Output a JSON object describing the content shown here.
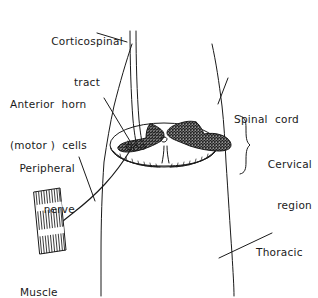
{
  "figure": {
    "type": "anatomical-diagram",
    "ink_color": "#1a1a1a",
    "background_color": "#ffffff"
  },
  "labels": {
    "corticospinal_tract": {
      "line1": "Corticospinal",
      "line2": "tract",
      "align": "center"
    },
    "anterior_horn_cells": {
      "line1": "Anterior  horn",
      "line2": "(motor )  cells",
      "align": "left"
    },
    "peripheral_nerve": {
      "line1": "Peripheral",
      "line2": "nerve",
      "align": "right"
    },
    "muscle": {
      "line1": "Muscle",
      "align": "left"
    },
    "spinal_cord": {
      "line1": "Spinal  cord",
      "align": "left"
    },
    "cervical_region": {
      "line1": "Cervical",
      "line2": "region",
      "align": "right"
    },
    "thoracic": {
      "line1": "Thoracic",
      "align": "left"
    }
  },
  "structures": {
    "spinal_cord_section": "elliptical cross-section of cervical spinal cord",
    "gray_matter": "stippled butterfly-shaped grey matter with anterior and posterior horns",
    "corticospinal_tract": "two parallel descending fibres entering the lateral column",
    "anterior_horn_cells": "cluster of small motor neuron cell bodies in the anterior horn",
    "peripheral_nerve": "axon leaving the cord and running to the muscle",
    "muscle": "striated muscle belly with vertical fibres",
    "cervical_brace": "right-hand brace marking the cervical region",
    "neck_outline": "outline of the neck and trunk"
  }
}
